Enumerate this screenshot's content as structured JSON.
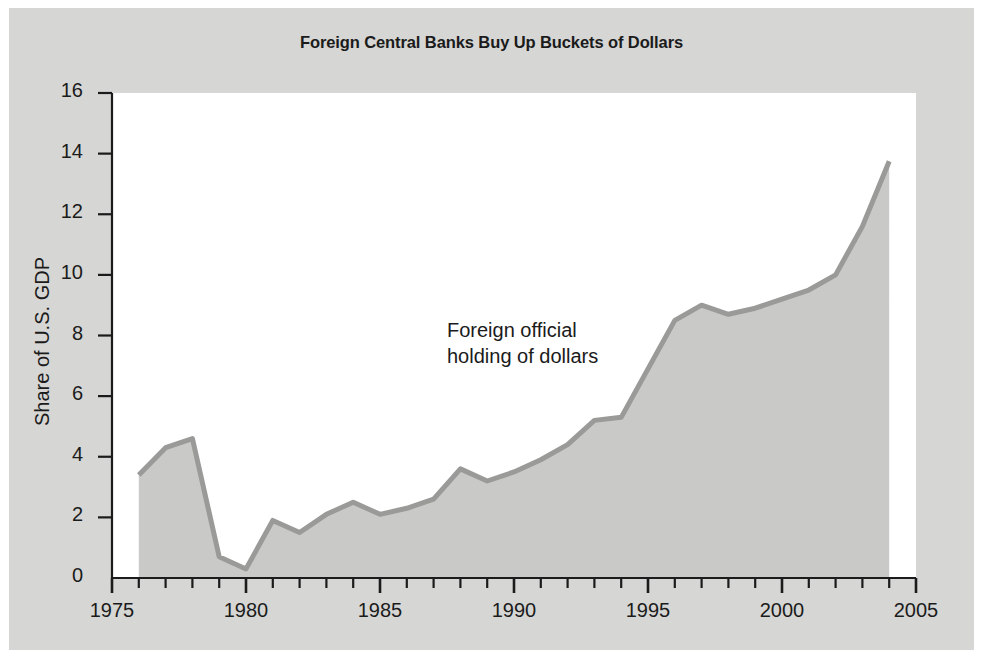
{
  "figure": {
    "background_color": "#d6d6d4",
    "plot_background_color": "#ffffff",
    "title": "Foreign Central Banks Buy Up Buckets of Dollars"
  },
  "annotation": {
    "line1": "Foreign official",
    "line2": "holding of dollars"
  },
  "chart_data": {
    "type": "area",
    "title": "Foreign Central Banks Buy Up Buckets of Dollars",
    "xlabel": "",
    "ylabel": "Share of U.S. GDP",
    "xlim": [
      1975,
      2005
    ],
    "ylim": [
      0,
      16
    ],
    "xticks": [
      1975,
      1980,
      1985,
      1990,
      1995,
      2000,
      2005
    ],
    "xtick_labels": [
      "1975",
      "1980",
      "1985",
      "1990",
      "1995",
      "2000",
      "2005"
    ],
    "x_minor_tick_step": 1,
    "yticks": [
      0,
      2,
      4,
      6,
      8,
      10,
      12,
      14,
      16
    ],
    "ytick_labels": [
      "0",
      "2",
      "4",
      "6",
      "8",
      "10",
      "12",
      "14",
      "16"
    ],
    "grid": false,
    "legend": null,
    "series": [
      {
        "name": "Foreign official holding of dollars",
        "fill_color": "#c9c9c7",
        "line_color": "#9a9a98",
        "x": [
          1976,
          1977,
          1978,
          1979,
          1980,
          1981,
          1982,
          1983,
          1984,
          1985,
          1986,
          1987,
          1988,
          1989,
          1990,
          1991,
          1992,
          1993,
          1994,
          1995,
          1996,
          1997,
          1998,
          1999,
          2000,
          2001,
          2002,
          2003,
          2004
        ],
        "values": [
          3.4,
          4.3,
          4.6,
          0.7,
          0.3,
          1.9,
          1.5,
          2.1,
          2.5,
          2.1,
          2.3,
          2.6,
          3.6,
          3.2,
          3.5,
          3.9,
          4.4,
          5.2,
          5.3,
          6.9,
          8.5,
          9.0,
          8.7,
          8.9,
          9.2,
          9.5,
          10.0,
          11.6,
          13.75
        ]
      }
    ]
  }
}
